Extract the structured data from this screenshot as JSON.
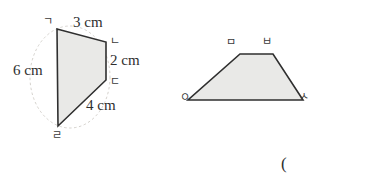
{
  "page": {
    "background_color": "#ffffff",
    "width": 386,
    "height": 188
  },
  "figure_left": {
    "name": "quadrilateral-gndr",
    "shape_fill": "#e9e9e7",
    "shape_stroke": "#2f2f2f",
    "guide_circle_stroke": "#c9c6c0",
    "vertices": [
      {
        "label": "ㄱ",
        "name": "vertex-giyeok",
        "x": 57,
        "y": 29
      },
      {
        "label": "ㄴ",
        "name": "vertex-nieun",
        "x": 106,
        "y": 42
      },
      {
        "label": "ㄷ",
        "name": "vertex-digeut",
        "x": 106,
        "y": 80
      },
      {
        "label": "ㄹ",
        "name": "vertex-rieul",
        "x": 58,
        "y": 126
      }
    ],
    "vertex_label_positions": [
      {
        "label": "ㄱ",
        "x": 43,
        "y": 16
      },
      {
        "label": "ㄴ",
        "x": 110,
        "y": 36
      },
      {
        "label": "ㄷ",
        "x": 110,
        "y": 76
      },
      {
        "label": "ㄹ",
        "x": 52,
        "y": 130
      }
    ],
    "dimensions": [
      {
        "name": "side-gn-length",
        "value": "3 cm",
        "x": 73,
        "y": 15
      },
      {
        "name": "side-nd-length",
        "value": "2 cm",
        "x": 110,
        "y": 53
      },
      {
        "name": "side-dr-length",
        "value": "4 cm",
        "x": 86,
        "y": 98
      },
      {
        "name": "side-rg-length",
        "value": "6 cm",
        "x": 13,
        "y": 63
      }
    ]
  },
  "figure_right": {
    "name": "trapezoid-obsa",
    "shape_fill": "#e9e9e7",
    "shape_stroke": "#2f2f2f",
    "vertices": [
      {
        "label": "ㅁ",
        "name": "vertex-mieum",
        "x": 240,
        "y": 54
      },
      {
        "label": "ㅂ",
        "name": "vertex-bieup",
        "x": 273,
        "y": 54
      },
      {
        "label": "ㅅ",
        "name": "vertex-siot",
        "x": 303,
        "y": 100
      },
      {
        "label": "ㅇ",
        "name": "vertex-ieung",
        "x": 188,
        "y": 100
      }
    ],
    "vertex_label_positions": [
      {
        "label": "ㅁ",
        "x": 226,
        "y": 37
      },
      {
        "label": "ㅂ",
        "x": 262,
        "y": 36
      },
      {
        "label": "ㅇ",
        "x": 180,
        "y": 92
      },
      {
        "label": "ㅅ",
        "x": 299,
        "y": 91
      }
    ]
  },
  "answer_marker": {
    "name": "answer-parenthesis",
    "text": "(",
    "x": 281,
    "y": 155
  }
}
